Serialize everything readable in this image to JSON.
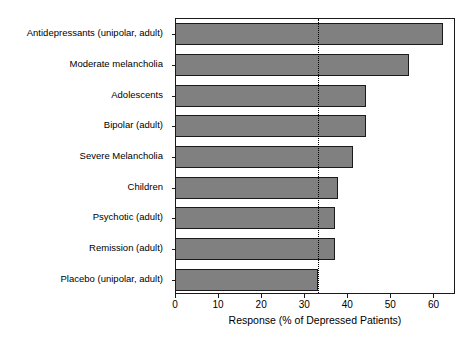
{
  "chart_data": {
    "type": "bar",
    "orientation": "horizontal",
    "title": "",
    "xlabel": "Response (% of Depressed Patients)",
    "ylabel": "",
    "xlim": [
      0,
      65
    ],
    "ylim": [
      0,
      9
    ],
    "grid": false,
    "legend": null,
    "xticks": [
      0,
      10,
      20,
      30,
      40,
      50,
      60
    ],
    "xtick_labels": [
      "0",
      "10",
      "20",
      "30",
      "40",
      "50",
      "60"
    ],
    "categories": [
      "Antidepressants (unipolar, adult)",
      "Moderate melancholia",
      "Adolescents",
      "Bipolar (adult)",
      "Severe Melancholia",
      "Children",
      "Psychotic (adult)",
      "Remission (adult)",
      "Placebo (unipolar, adult)"
    ],
    "values": [
      62,
      54,
      44,
      44,
      41,
      37.5,
      37,
      37,
      33
    ],
    "bar_color": "#808080",
    "bar_edge_color": "#1a1a1a",
    "reference_line": {
      "value": 33,
      "style": "dotted",
      "color": "#000000"
    }
  },
  "axis": {
    "frame_color": "#1a1a1a"
  }
}
